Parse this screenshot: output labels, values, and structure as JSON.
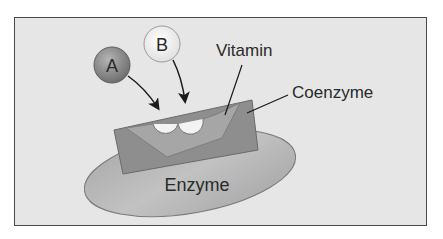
{
  "diagram": {
    "labels": {
      "substrate_a": "A",
      "substrate_b": "B",
      "vitamin": "Vitamin",
      "coenzyme": "Coenzyme",
      "enzyme": "Enzyme"
    },
    "colors": {
      "background": "#e6e6e6",
      "frame": "#4a4a4a",
      "enzyme_fill": "#b3b3b3",
      "coenzyme_fill": "#8c8c8c",
      "vitamin_fill": "#a8a8a8",
      "sphere_a": "#8a8a8a",
      "sphere_b": "#f2f2f2"
    }
  }
}
